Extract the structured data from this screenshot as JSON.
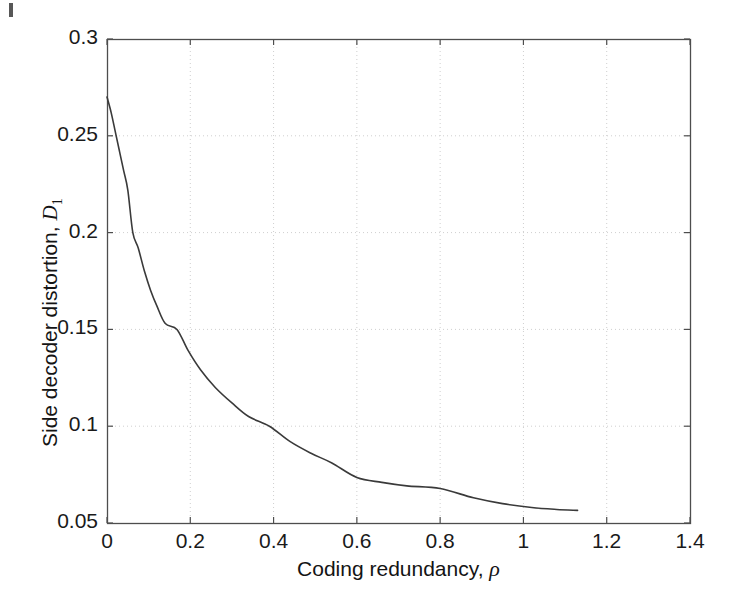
{
  "figure": {
    "background_color": "#ffffff",
    "axis_color": "#4d4d4d",
    "grid_color": "#cfcfcf",
    "curve_color": "#3a3a3a"
  },
  "axes": {
    "x_title_prefix": "Coding redundancy, ",
    "x_title_symbol": "ρ",
    "y_title_prefix": "Side decoder distortion, ",
    "y_title_symbol": "D",
    "y_title_subscript": "1"
  },
  "chart_data": {
    "type": "line",
    "title": "",
    "subtitle": "",
    "xlabel": "Coding redundancy, ρ",
    "ylabel": "Side decoder distortion, D₁",
    "xlim": [
      0,
      1.4
    ],
    "ylim": [
      0.05,
      0.3
    ],
    "xticks": [
      0,
      0.2,
      0.4,
      0.6,
      0.8,
      1,
      1.2,
      1.4
    ],
    "xtick_labels": [
      "0",
      "0.2",
      "0.4",
      "0.6",
      "0.8",
      "1",
      "1.2",
      "1.4"
    ],
    "yticks": [
      0.05,
      0.1,
      0.15,
      0.2,
      0.25,
      0.3
    ],
    "ytick_labels": [
      "0.05",
      "0.1",
      "0.15",
      "0.2",
      "0.25",
      "0.3"
    ],
    "grid": true,
    "grid_style": "dotted",
    "legend": null,
    "legend_position": "none",
    "annotations": [],
    "series": [
      {
        "name": "Side decoder distortion vs coding redundancy",
        "color": "#3a3a3a",
        "line_width": 1.6,
        "x": [
          0.0,
          0.01,
          0.02,
          0.03,
          0.04,
          0.05,
          0.062,
          0.075,
          0.09,
          0.105,
          0.12,
          0.14,
          0.168,
          0.195,
          0.225,
          0.26,
          0.3,
          0.34,
          0.39,
          0.44,
          0.49,
          0.54,
          0.6,
          0.66,
          0.72,
          0.8,
          0.88,
          0.95,
          1.02,
          1.08,
          1.13
        ],
        "y": [
          0.27,
          0.262,
          0.252,
          0.242,
          0.232,
          0.222,
          0.2,
          0.192,
          0.18,
          0.17,
          0.162,
          0.153,
          0.15,
          0.139,
          0.129,
          0.12,
          0.112,
          0.105,
          0.1,
          0.092,
          0.086,
          0.081,
          0.0735,
          0.071,
          0.0692,
          0.0678,
          0.063,
          0.06,
          0.058,
          0.057,
          0.0565
        ]
      }
    ]
  },
  "plot_box": {
    "left": 107,
    "top": 39,
    "right": 690,
    "bottom": 523
  }
}
